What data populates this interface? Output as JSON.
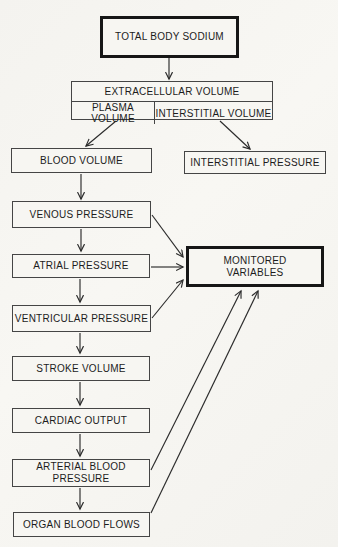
{
  "diagram": {
    "type": "flowchart",
    "colors": {
      "paper": "#f6f5f1",
      "ink": "#1c1c1c",
      "box_border": "#454545",
      "thick_box_border": "#161616"
    },
    "nodes": {
      "total_body_sodium": {
        "label": "TOTAL BODY SODIUM",
        "emphasis": "thick-border"
      },
      "extracellular_volume": {
        "label": "EXTRACELLULAR VOLUME"
      },
      "plasma_volume": {
        "label": "PLASMA VOLUME"
      },
      "interstitial_volume": {
        "label": "INTERSTITIAL VOLUME"
      },
      "blood_volume": {
        "label": "BLOOD VOLUME"
      },
      "interstitial_pressure": {
        "label": "INTERSTITIAL PRESSURE"
      },
      "venous_pressure": {
        "label": "VENOUS PRESSURE"
      },
      "atrial_pressure": {
        "label": "ATRIAL PRESSURE"
      },
      "monitored_variables": {
        "label": "MONITORED\nVARIABLES",
        "emphasis": "thick-border"
      },
      "ventricular_pressure": {
        "label": "VENTRICULAR PRESSURE"
      },
      "stroke_volume": {
        "label": "STROKE VOLUME"
      },
      "cardiac_output": {
        "label": "CARDIAC OUTPUT"
      },
      "arterial_blood_pressure": {
        "label": "ARTERIAL BLOOD\nPRESSURE"
      },
      "organ_blood_flows": {
        "label": "ORGAN BLOOD FLOWS"
      }
    },
    "edges": [
      {
        "from": "total_body_sodium",
        "to": "extracellular_volume"
      },
      {
        "from": "plasma_volume",
        "to": "blood_volume"
      },
      {
        "from": "interstitial_volume",
        "to": "interstitial_pressure"
      },
      {
        "from": "blood_volume",
        "to": "venous_pressure"
      },
      {
        "from": "venous_pressure",
        "to": "atrial_pressure"
      },
      {
        "from": "atrial_pressure",
        "to": "ventricular_pressure"
      },
      {
        "from": "ventricular_pressure",
        "to": "stroke_volume"
      },
      {
        "from": "stroke_volume",
        "to": "cardiac_output"
      },
      {
        "from": "cardiac_output",
        "to": "arterial_blood_pressure"
      },
      {
        "from": "arterial_blood_pressure",
        "to": "organ_blood_flows"
      },
      {
        "from": "venous_pressure",
        "to": "monitored_variables"
      },
      {
        "from": "atrial_pressure",
        "to": "monitored_variables"
      },
      {
        "from": "ventricular_pressure",
        "to": "monitored_variables"
      },
      {
        "from": "arterial_blood_pressure",
        "to": "monitored_variables"
      },
      {
        "from": "organ_blood_flows",
        "to": "monitored_variables"
      }
    ]
  }
}
